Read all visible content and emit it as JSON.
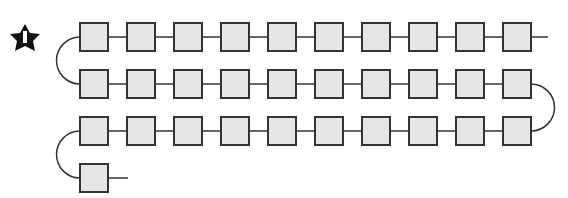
{
  "badge": {
    "number": "1",
    "icon": "star-icon"
  },
  "diagram": {
    "rows": [
      {
        "count": 10,
        "direction": "ltr"
      },
      {
        "count": 10,
        "direction": "rtl"
      },
      {
        "count": 10,
        "direction": "ltr"
      },
      {
        "count": 1,
        "direction": "ltr"
      }
    ],
    "total_boxes": 31,
    "box_fill": "#e6e6e6",
    "stroke": "#333333"
  }
}
